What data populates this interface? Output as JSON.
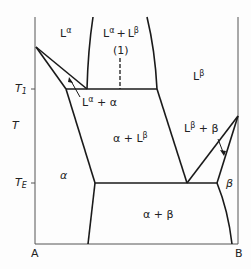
{
  "diagram": {
    "type": "binary-phase-diagram",
    "axes": {
      "y_label": "T",
      "x_left": "A",
      "x_right": "B",
      "temperature_marks": [
        {
          "label": "T",
          "sub": "1"
        },
        {
          "label": "T",
          "sub": "E"
        }
      ]
    },
    "regions": [
      {
        "id": "L-alpha",
        "base": "L",
        "sup": "α"
      },
      {
        "id": "L-alpha-L-beta",
        "base": "L",
        "sup": "α",
        "plus": "+",
        "base2": "L",
        "sup2": "β"
      },
      {
        "id": "L-beta",
        "base": "L",
        "sup": "β"
      },
      {
        "id": "L-alpha-plus-alpha",
        "text1": "L",
        "sup": "α",
        "text2": " + α"
      },
      {
        "id": "alpha-plus-L-beta",
        "text1": "α + L",
        "sup": "β"
      },
      {
        "id": "L-beta-plus-beta",
        "text1": "L",
        "sup": "β",
        "text2": " + β"
      },
      {
        "id": "alpha",
        "text": "α"
      },
      {
        "id": "beta",
        "text": "β"
      },
      {
        "id": "alpha-plus-beta",
        "text": "α + β"
      }
    ],
    "annotations": {
      "composition_marker": "(1)"
    },
    "colors": {
      "line": "#1a1a1a",
      "background": "#fdfdfd"
    }
  }
}
